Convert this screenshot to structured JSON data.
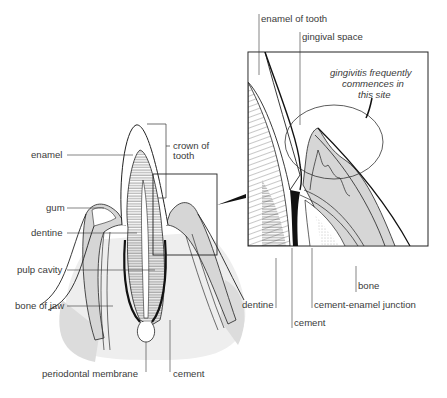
{
  "diagram": {
    "type": "anatomical-cross-section",
    "left_panel": {
      "labels": {
        "enamel": "enamel",
        "crown_line1": "crown of",
        "crown_line2": "tooth",
        "gum": "gum",
        "dentine": "dentine",
        "pulp_cavity": "pulp cavity",
        "bone_of_jaw": "bone of jaw",
        "periodontal_membrane": "periodontal membrane",
        "cement": "cement"
      }
    },
    "inset_panel": {
      "labels": {
        "enamel_of_tooth": "enamel of tooth",
        "gingival_space": "gingival space",
        "note_line1": "gingivitis frequently",
        "note_line2": "commences in",
        "note_line3": "this site",
        "bone": "bone",
        "dentine": "dentine",
        "cement_enamel_junction": "cement-enamel junction",
        "cement": "cement"
      }
    },
    "colors": {
      "line": "#1a1a1a",
      "gum_fill": "#d6d6d6",
      "bone_fill": "#ececec",
      "text": "#3a3a3a"
    }
  }
}
